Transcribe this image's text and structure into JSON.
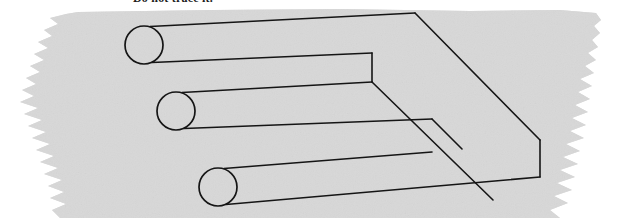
{
  "canvas": {
    "width": 626,
    "height": 218,
    "background_color": "#ffffff"
  },
  "caption": {
    "text": "Do not trace it.",
    "note": "clipped at top edge of image",
    "color": "#1d1d1d"
  },
  "paper": {
    "name": "torn-gray-paper-sheet",
    "fill_color": "#d8d8d8",
    "edge_style": "ragged-torn",
    "description": "Light gray paper swatch with irregular torn left and right edges, bleeding off bottom of frame"
  },
  "figure": {
    "name": "impossible-trident",
    "alt_names": [
      "Devil's Tuning Fork",
      "blivet",
      "impossible fork"
    ],
    "stroke_color": "#151515",
    "stroke_width": 1.6,
    "prong_count": 3,
    "prongs": [
      {
        "label": "prong-top",
        "cap_cx": 144,
        "cap_cy": 45,
        "cap_rx": 19,
        "cap_ry": 19
      },
      {
        "label": "prong-middle",
        "cap_cx": 176,
        "cap_cy": 111,
        "cap_rx": 19,
        "cap_ry": 19
      },
      {
        "label": "prong-bottom",
        "cap_cx": 218,
        "cap_cy": 187,
        "cap_rx": 19,
        "cap_ry": 19
      }
    ],
    "bar": {
      "label": "flat-bar-right",
      "far_corner_x": 415,
      "far_corner_y": 13,
      "right_corner_x": 540,
      "right_corner_y": 140
    }
  }
}
